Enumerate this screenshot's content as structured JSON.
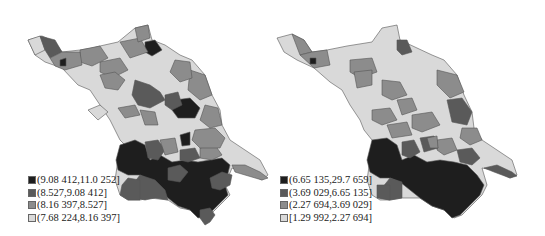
{
  "maps": [
    {
      "id": "left",
      "legend": [
        {
          "label": "(9.08 412,11.0 252]",
          "color": "#1e1e1e"
        },
        {
          "label": "(8.527,9.08 412]",
          "color": "#5a5a5a"
        },
        {
          "label": "(8.16 397,8.527]",
          "color": "#8c8c8c"
        },
        {
          "label": "(7.68 224,8.16 397]",
          "color": "#d9d9d9"
        }
      ]
    },
    {
      "id": "right",
      "legend": [
        {
          "label": "(6.65 135,29.7 659]",
          "color": "#1e1e1e"
        },
        {
          "label": "(3.69 029,6.65 135]",
          "color": "#5a5a5a"
        },
        {
          "label": "(2.27 694,3.69 029]",
          "color": "#8c8c8c"
        },
        {
          "label": "[1.29 992,2.27 694]",
          "color": "#d9d9d9"
        }
      ]
    }
  ]
}
